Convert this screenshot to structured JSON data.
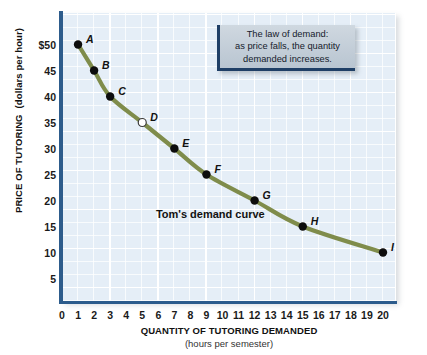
{
  "chart_data": {
    "type": "line",
    "title": "",
    "xlabel": "QUANTITY OF TUTORING DEMANDED",
    "xsublabel": "(hours per semester)",
    "ylabel_main": "PRICE OF TUTORING",
    "ylabel_sub": "(dollars per hour)",
    "xlim": [
      0,
      20
    ],
    "ylim": [
      0,
      52
    ],
    "grid": true,
    "legend": "none",
    "curve_color": "#7f8c4b",
    "series": [
      {
        "name": "Tom's demand curve",
        "x": [
          1,
          2,
          3,
          5,
          7,
          9,
          12,
          15,
          20
        ],
        "values": [
          50,
          45,
          40,
          35,
          30,
          25,
          20,
          15,
          10
        ]
      }
    ],
    "points": [
      {
        "label": "A",
        "x": 1,
        "y": 50,
        "filled": true,
        "label_dx": 8,
        "label_dy": -12
      },
      {
        "label": "B",
        "x": 2,
        "y": 45,
        "filled": true,
        "label_dx": 8,
        "label_dy": -12
      },
      {
        "label": "C",
        "x": 3,
        "y": 40,
        "filled": true,
        "label_dx": 8,
        "label_dy": -12
      },
      {
        "label": "D",
        "x": 5,
        "y": 35,
        "filled": false,
        "label_dx": 8,
        "label_dy": -12
      },
      {
        "label": "E",
        "x": 7,
        "y": 30,
        "filled": true,
        "label_dx": 8,
        "label_dy": -12
      },
      {
        "label": "F",
        "x": 9,
        "y": 25,
        "filled": true,
        "label_dx": 8,
        "label_dy": -12
      },
      {
        "label": "G",
        "x": 12,
        "y": 20,
        "filled": true,
        "label_dx": 8,
        "label_dy": -12
      },
      {
        "label": "H",
        "x": 15,
        "y": 15,
        "filled": true,
        "label_dx": 8,
        "label_dy": -12
      },
      {
        "label": "I",
        "x": 20,
        "y": 10,
        "filled": true,
        "label_dx": 8,
        "label_dy": -12
      }
    ],
    "xticks": [
      "0",
      "1",
      "2",
      "3",
      "4",
      "5",
      "6",
      "7",
      "8",
      "9",
      "10",
      "11",
      "12",
      "13",
      "14",
      "15",
      "16",
      "17",
      "18",
      "19",
      "20"
    ],
    "xtick_values": [
      0,
      1,
      2,
      3,
      4,
      5,
      6,
      7,
      8,
      9,
      10,
      11,
      12,
      13,
      14,
      15,
      16,
      17,
      18,
      19,
      20
    ],
    "yticks": [
      "$50",
      "45",
      "40",
      "35",
      "30",
      "25",
      "20",
      "15",
      "10",
      "5"
    ],
    "ytick_values": [
      50,
      45,
      40,
      35,
      30,
      25,
      20,
      15,
      10,
      5
    ]
  },
  "annotations": {
    "curve_name": "Tom's demand curve",
    "curve_name_x": 5.85,
    "curve_name_y": 17.2,
    "callout": {
      "line1": "The law of demand:",
      "line2": "as price falls, the quantity",
      "line3": "demanded increases."
    }
  },
  "colors": {
    "panel_background": "#e5eef7",
    "grid_line": "#ffffff",
    "axis": "#2d5c8c",
    "curve": "#7f8c4b",
    "point_fill": "#0d0d0d",
    "callout_fill": "#bfcad5",
    "callout_border": "#1f3f66"
  }
}
